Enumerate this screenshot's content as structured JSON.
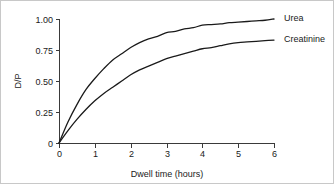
{
  "chart_data": {
    "type": "line",
    "title": "",
    "xlabel": "Dwell time (hours)",
    "ylabel": "D/P",
    "xlim": [
      0,
      6
    ],
    "ylim": [
      0,
      1.0
    ],
    "grid": false,
    "legend_position": "right-of-curve-ends",
    "xticks": [
      0,
      1,
      2,
      3,
      4,
      5,
      6
    ],
    "xtick_labels": [
      "0",
      "1",
      "2",
      "3",
      "4",
      "5",
      "6"
    ],
    "yticks": [
      0,
      0.25,
      0.5,
      0.75,
      1.0
    ],
    "ytick_labels": [
      "0",
      "0.25",
      "0.50",
      "0.75",
      "1.00"
    ],
    "line_color": "#1a1a1a",
    "axis_color": "#3a3a3a",
    "background_color": "#ffffff",
    "series": [
      {
        "name": "Urea",
        "label": "Urea",
        "x": [
          0,
          0.25,
          0.5,
          0.75,
          1.0,
          1.25,
          1.5,
          1.75,
          2.0,
          2.25,
          2.5,
          2.75,
          3.0,
          3.25,
          3.5,
          3.75,
          4.0,
          4.25,
          4.5,
          4.75,
          5.0,
          5.25,
          5.5,
          5.75,
          6.0
        ],
        "values": [
          0,
          0.17,
          0.31,
          0.43,
          0.52,
          0.6,
          0.67,
          0.72,
          0.77,
          0.81,
          0.84,
          0.86,
          0.89,
          0.9,
          0.92,
          0.93,
          0.95,
          0.955,
          0.96,
          0.97,
          0.975,
          0.98,
          0.985,
          0.99,
          1.0
        ]
      },
      {
        "name": "Creatinine",
        "label": "Creatinine",
        "x": [
          0,
          0.25,
          0.5,
          0.75,
          1.0,
          1.25,
          1.5,
          1.75,
          2.0,
          2.25,
          2.5,
          2.75,
          3.0,
          3.25,
          3.5,
          3.75,
          4.0,
          4.25,
          4.5,
          4.75,
          5.0,
          5.25,
          5.5,
          5.75,
          6.0
        ],
        "values": [
          0,
          0.1,
          0.19,
          0.27,
          0.34,
          0.4,
          0.45,
          0.5,
          0.55,
          0.59,
          0.62,
          0.65,
          0.68,
          0.7,
          0.72,
          0.74,
          0.76,
          0.77,
          0.785,
          0.8,
          0.81,
          0.815,
          0.82,
          0.825,
          0.83
        ]
      }
    ]
  }
}
